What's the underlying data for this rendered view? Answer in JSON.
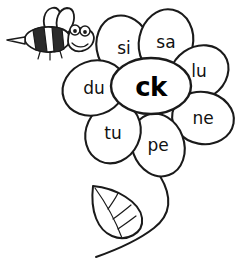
{
  "worksheet": {
    "title": "ck syllable flower",
    "background_color": "#ffffff",
    "line_color": "#1a1a1a"
  },
  "flower": {
    "center": {
      "label": "ck",
      "name": "flower-center"
    },
    "petals": [
      {
        "label": "si",
        "name": "petal-si",
        "cx": 124,
        "cy": 48,
        "rx": 27,
        "ry": 33,
        "rotate": -18,
        "tx": 124,
        "ty": 48
      },
      {
        "label": "sa",
        "name": "petal-sa",
        "cx": 166,
        "cy": 42,
        "rx": 27,
        "ry": 33,
        "rotate": 12,
        "tx": 166,
        "ty": 42
      },
      {
        "label": "lu",
        "name": "petal-lu",
        "cx": 199,
        "cy": 73,
        "rx": 26,
        "ry": 31,
        "rotate": 55,
        "tx": 199,
        "ty": 71
      },
      {
        "label": "ne",
        "name": "petal-ne",
        "cx": 203,
        "cy": 118,
        "rx": 26,
        "ry": 31,
        "rotate": 100,
        "tx": 203,
        "ty": 118
      },
      {
        "label": "pe",
        "name": "petal-pe",
        "cx": 158,
        "cy": 145,
        "rx": 26,
        "ry": 32,
        "rotate": 160,
        "tx": 158,
        "ty": 145
      },
      {
        "label": "tu",
        "name": "petal-tu",
        "cx": 113,
        "cy": 133,
        "rx": 27,
        "ry": 31,
        "rotate": 205,
        "tx": 113,
        "ty": 133
      },
      {
        "label": "du",
        "name": "petal-du",
        "cx": 94,
        "cy": 88,
        "rx": 27,
        "ry": 32,
        "rotate": 250,
        "tx": 94,
        "ty": 88
      }
    ]
  },
  "bee": {
    "name": "bee-illustration",
    "description": "cartoon bumble bee flying toward the flower"
  },
  "stem": {
    "name": "flower-stem",
    "description": "curved stem from flower to lower left"
  },
  "leaf": {
    "name": "flower-leaf",
    "description": "single pointed leaf with veins on the stem"
  }
}
